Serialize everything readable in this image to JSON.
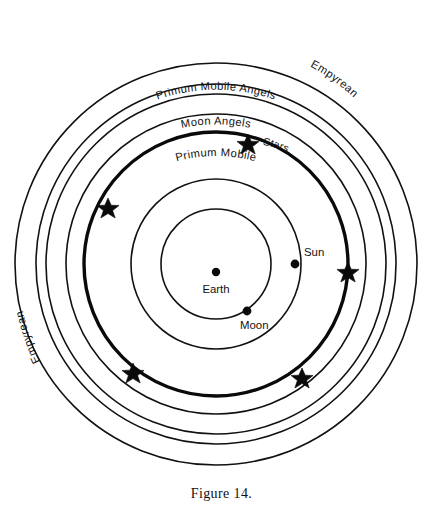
{
  "figure": {
    "caption": "Figure 14.",
    "center": {
      "x": 216,
      "y": 264
    }
  },
  "spheres": [
    {
      "name": "moon-sphere",
      "radius": 55,
      "thick": false,
      "label": ""
    },
    {
      "name": "sun-sphere",
      "radius": 85,
      "thick": false,
      "label": ""
    },
    {
      "name": "stars-sphere",
      "radius": 132,
      "thick": true,
      "label": "Stars"
    },
    {
      "name": "primum-mobile-sphere",
      "radius": 150,
      "thick": false,
      "label": "Primum Mobile"
    },
    {
      "name": "moon-angels-sphere",
      "radius": 170,
      "thick": false,
      "label": "Moon Angels"
    },
    {
      "name": "primum-mobile-angels-sphere",
      "radius": 180,
      "thick": false,
      "label": "Primum Mobile Angels"
    },
    {
      "name": "empyrean-sphere",
      "radius": 201,
      "thick": false,
      "label": "Empyrean"
    }
  ],
  "curved_labels": {
    "empyrean_top": "Empyrean",
    "empyrean_bottom": "Empyrean",
    "primum_mobile_angels": "Primum  Mobile  Angels",
    "moon_angels": "Moon  Angels",
    "primum_mobile": "Primum  Mobile",
    "stars": "Stars"
  },
  "bodies": [
    {
      "name": "earth",
      "label": "Earth",
      "x": 216,
      "y": 272,
      "dot": true
    },
    {
      "name": "sun",
      "label": "Sun",
      "x": 295,
      "y": 264,
      "dot": true
    },
    {
      "name": "moon",
      "label": "Moon",
      "x": 247,
      "y": 311,
      "dot": true
    }
  ],
  "body_labels": {
    "earth": "Earth",
    "sun": "Sun",
    "moon": "Moon"
  },
  "stars": [
    {
      "name": "star-top",
      "x": 248,
      "y": 144
    },
    {
      "name": "star-upper-left",
      "x": 108,
      "y": 208
    },
    {
      "name": "star-right",
      "x": 348,
      "y": 272
    },
    {
      "name": "star-lower-left",
      "x": 133,
      "y": 373
    },
    {
      "name": "star-lower-right",
      "x": 302,
      "y": 378
    }
  ],
  "colors": {
    "ink": "#111111",
    "background": "#ffffff"
  }
}
